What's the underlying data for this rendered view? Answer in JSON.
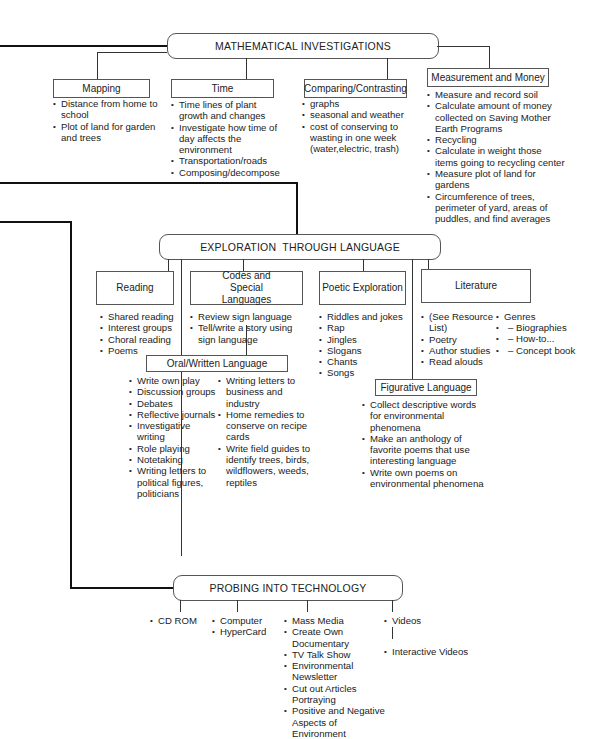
{
  "math": {
    "title": "MATHEMATICAL INVESTIGATIONS",
    "branches": [
      {
        "label": "Mapping",
        "items": [
          "Distance from home to school",
          "Plot of land for garden and trees"
        ]
      },
      {
        "label": "Time",
        "items": [
          "Time lines of plant growth and changes",
          "Investigate how time of day affects the environment",
          "Transportation/roads",
          "Composing/decompose"
        ]
      },
      {
        "label": "Comparing/Contrasting",
        "items": [
          "graphs",
          "seasonal and weather",
          "cost of conserving to wasting in one week (water,electric, trash)"
        ]
      },
      {
        "label": "Measurement and Money",
        "items": [
          "Measure and record soil",
          "Calculate amount of money collected on Saving Mother Earth Programs",
          "Recycling",
          "Calculate in weight those items going to recycling center",
          "Measure plot of land for gardens",
          "Circumference of trees, perimeter of yard, areas of puddles, and find averages"
        ]
      }
    ]
  },
  "language": {
    "title": "EXPLORATION  THROUGH LANGUAGE",
    "branches": [
      {
        "label": "Reading",
        "items": [
          "Shared reading",
          "Interest groups",
          "Choral reading",
          "Poems"
        ]
      },
      {
        "label": "Codes and Special Languages",
        "items": [
          "Review sign language",
          "Tell/write a story using sign language"
        ]
      },
      {
        "label": "Poetic Exploration",
        "items": [
          "Riddles and jokes",
          "Rap",
          "Jingles",
          "Slogans",
          "Chants",
          "Songs"
        ]
      },
      {
        "label": "Literature",
        "items_a": [
          "(See Resource List)",
          "Poetry",
          "Author studies",
          "Read alouds"
        ],
        "genres": {
          "label": "Genres",
          "items": [
            "Biographies",
            "How-to...",
            "Concept book"
          ]
        }
      },
      {
        "label": "Oral/Written Language",
        "items_a": [
          "Write own play",
          "Discussion groups",
          "Debates",
          "Reflective journals",
          "Investigative writing",
          "Role playing",
          "Notetaking",
          "Writing letters to political figures, politicians"
        ],
        "items_b": [
          "Writing letters to business and industry",
          "Home remedies to conserve on recipe cards",
          "Write field guides to identify trees, birds, wildflowers, weeds, reptiles"
        ]
      },
      {
        "label": "Figurative Language",
        "items": [
          "Collect descriptive words for environmental phenomena",
          "Make an anthology of favorite poems that use interesting language",
          "Write own poems on environmental phenomena"
        ]
      }
    ]
  },
  "tech": {
    "title": "PROBING INTO TECHNOLOGY",
    "groups": [
      {
        "items": [
          "CD ROM"
        ]
      },
      {
        "items": [
          "Computer",
          "HyperCard"
        ]
      },
      {
        "items": [
          "Mass Media",
          "Create Own Documentary",
          "TV Talk Show",
          "Environmental Newsletter",
          "Cut out Articles Portraying",
          "Positive and Negative Aspects of Environment"
        ]
      },
      {
        "items": [
          "Videos"
        ]
      },
      {
        "items": [
          "Interactive Videos"
        ]
      }
    ]
  }
}
